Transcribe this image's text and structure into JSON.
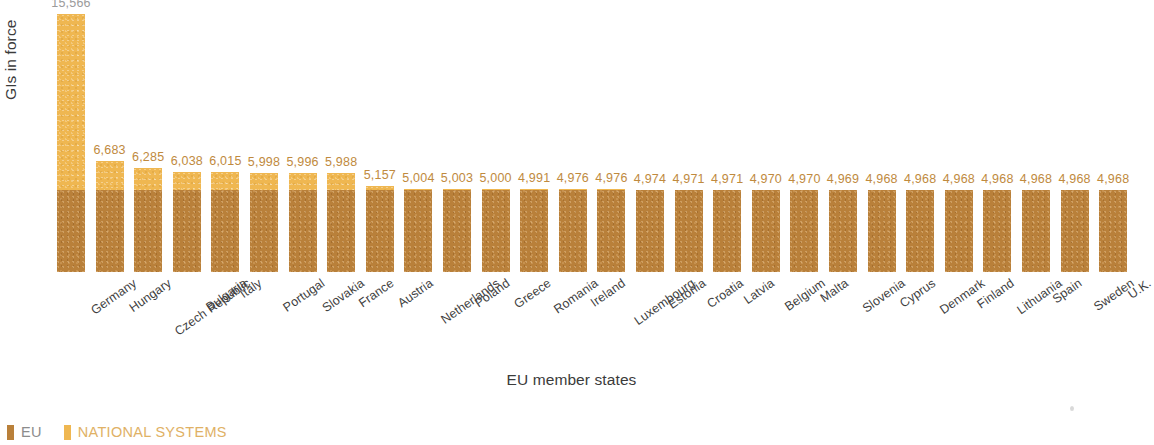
{
  "chart_data": {
    "type": "bar",
    "subtype": "stacked-column",
    "title": "",
    "xlabel": "EU member states",
    "ylabel": "GIs in force",
    "ylim": [
      0,
      16400
    ],
    "grid": false,
    "legend_position": "bottom-left",
    "categories": [
      "Germany",
      "Hungary",
      "Czech Republic",
      "Bulgaria",
      "Italy",
      "Portugal",
      "Slovakia",
      "France",
      "Austria",
      "Netherlands",
      "Poland",
      "Greece",
      "Romania",
      "Ireland",
      "Luxembourg",
      "Estonia",
      "Croatia",
      "Latvia",
      "Belgium",
      "Malta",
      "Slovenia",
      "Cyprus",
      "Denmark",
      "Finland",
      "Lithuania",
      "Spain",
      "Sweden",
      "U.K."
    ],
    "totals": [
      15566,
      6683,
      6285,
      6038,
      6015,
      5998,
      5996,
      5988,
      5157,
      5004,
      5003,
      5000,
      4991,
      4976,
      4976,
      4974,
      4971,
      4971,
      4970,
      4970,
      4969,
      4968,
      4968,
      4968,
      4968,
      4968,
      4968,
      4968
    ],
    "total_labels": [
      "15,566",
      "6,683",
      "6,285",
      "6,038",
      "6,015",
      "5,998",
      "5,996",
      "5,988",
      "5,157",
      "5,004",
      "5,003",
      "5,000",
      "4,991",
      "4,976",
      "4,976",
      "4,974",
      "4,971",
      "4,971",
      "4,970",
      "4,970",
      "4,969",
      "4,968",
      "4,968",
      "4,968",
      "4,968",
      "4,968",
      "4,968",
      "4,968"
    ],
    "series": [
      {
        "name": "EU",
        "color": "#b9803a",
        "values": [
          4968,
          4968,
          4968,
          4968,
          4968,
          4968,
          4968,
          4968,
          4968,
          4968,
          4968,
          4968,
          4968,
          4968,
          4968,
          4968,
          4968,
          4968,
          4968,
          4968,
          4968,
          4968,
          4968,
          4968,
          4968,
          4968,
          4968,
          4968
        ]
      },
      {
        "name": "NATIONAL SYSTEMS",
        "color": "#efb751",
        "values": [
          10598,
          1715,
          1317,
          1070,
          1047,
          1030,
          1028,
          1020,
          189,
          36,
          35,
          32,
          23,
          8,
          8,
          6,
          3,
          3,
          2,
          2,
          1,
          0,
          0,
          0,
          0,
          0,
          0,
          0
        ]
      }
    ]
  },
  "legend": {
    "items": [
      {
        "label": "EU",
        "color": "#b9803a"
      },
      {
        "label": "NATIONAL SYSTEMS",
        "color": "#efb751"
      }
    ]
  },
  "axes": {
    "y_title": "GIs in force",
    "x_title": "EU member states"
  }
}
